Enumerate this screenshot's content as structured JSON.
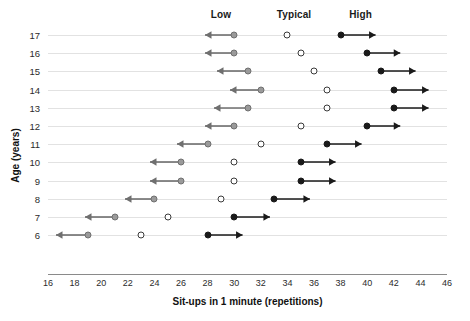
{
  "chart_data": {
    "type": "scatter",
    "title": "",
    "xlabel": "Sit-ups in 1 minute (repetitions)",
    "ylabel": "Age (years)",
    "xlim": [
      16,
      46
    ],
    "xticks": [
      16,
      18,
      20,
      22,
      24,
      26,
      28,
      30,
      32,
      34,
      36,
      38,
      40,
      42,
      44,
      46
    ],
    "categories": [
      17,
      16,
      15,
      14,
      13,
      12,
      11,
      10,
      9,
      8,
      7,
      6
    ],
    "grid": "horizontal-row-lines",
    "legend_position": "top",
    "band_labels": [
      {
        "label": "Low",
        "value": 29
      },
      {
        "label": "Typical",
        "value": 34.5
      },
      {
        "label": "High",
        "value": 39.5
      }
    ],
    "series": [
      {
        "name": "Low",
        "marker": "filled-gray-circle",
        "arrow": "left",
        "color": "#9a9a9a",
        "values": [
          30,
          30,
          31,
          32,
          31,
          30,
          28,
          26,
          26,
          24,
          21,
          19
        ]
      },
      {
        "name": "Typical",
        "marker": "open-circle",
        "arrow": "none",
        "color": "#ffffff",
        "values": [
          34,
          35,
          36,
          37,
          37,
          35,
          32,
          30,
          30,
          29,
          25,
          23
        ]
      },
      {
        "name": "High",
        "marker": "filled-black-circle",
        "arrow": "right",
        "color": "#1a1a1a",
        "values": [
          38,
          40,
          41,
          42,
          42,
          40,
          37,
          35,
          35,
          33,
          30,
          28
        ]
      }
    ],
    "arrow_spans": {
      "low_left_end": [
        27.8,
        27.8,
        28.7,
        29.7,
        28.5,
        27.8,
        25.7,
        23.7,
        23.7,
        21.8,
        18.8,
        16.6
      ],
      "high_right_end": [
        40.6,
        42.5,
        43.6,
        44.6,
        44.6,
        42.5,
        39.6,
        37.6,
        37.6,
        35.7,
        32.7,
        30.6
      ]
    },
    "rows": [
      {
        "age": 17,
        "low": 30,
        "typical": 34,
        "high": 38
      },
      {
        "age": 16,
        "low": 30,
        "typical": 35,
        "high": 40
      },
      {
        "age": 15,
        "low": 31,
        "typical": 36,
        "high": 41
      },
      {
        "age": 14,
        "low": 32,
        "typical": 37,
        "high": 42
      },
      {
        "age": 13,
        "low": 31,
        "typical": 37,
        "high": 42
      },
      {
        "age": 12,
        "low": 30,
        "typical": 35,
        "high": 40
      },
      {
        "age": 11,
        "low": 28,
        "typical": 32,
        "high": 37
      },
      {
        "age": 10,
        "low": 26,
        "typical": 30,
        "high": 35
      },
      {
        "age": 9,
        "low": 26,
        "typical": 30,
        "high": 35
      },
      {
        "age": 8,
        "low": 24,
        "typical": 29,
        "high": 33
      },
      {
        "age": 7,
        "low": 21,
        "typical": 25,
        "high": 30
      },
      {
        "age": 6,
        "low": 19,
        "typical": 23,
        "high": 28
      }
    ],
    "colors": {
      "low_marker": "#9a9a9a",
      "typical_marker": "#ffffff",
      "high_marker": "#1a1a1a",
      "low_arrow": "#6f6f6f",
      "high_arrow": "#1a1a1a",
      "row_line": "#e2e2e2",
      "axis": "#8a8a8a",
      "text": "#1a1a1a"
    }
  },
  "geometry": {
    "plot_left": 48,
    "plot_right": 447,
    "row_top": 35,
    "row_step": 18.2,
    "axis_y": 274,
    "xtick_label_y": 278,
    "xtitle_y": 296,
    "ytitle_x": 10,
    "ytitle_y": 150,
    "band_label_y": 9
  }
}
